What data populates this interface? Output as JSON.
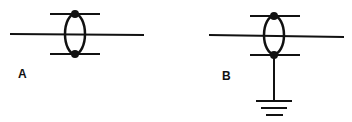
{
  "diagram": {
    "panels": [
      {
        "label": "A",
        "description": "Conductor line with ring element (two bars joined by oval, dots at junctions), not grounded",
        "grounded": false
      },
      {
        "label": "B",
        "description": "Conductor line with ring element (two bars joined by oval, dots at junctions), lower junction connected to ground symbol",
        "grounded": true
      }
    ],
    "colors": {
      "stroke": "#111111",
      "background": "#ffffff"
    }
  }
}
